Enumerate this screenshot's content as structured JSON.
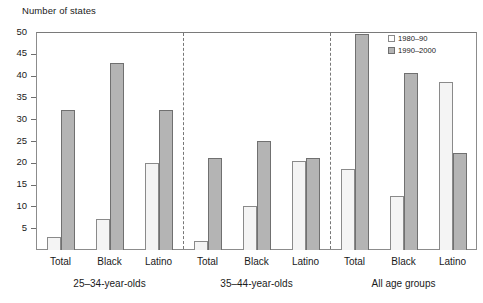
{
  "chart_data": {
    "type": "bar",
    "title": "",
    "subtitle": "",
    "xlabel": "",
    "ylabel": "Number of states",
    "ylim": [
      0,
      50
    ],
    "yticks": [
      0,
      5,
      10,
      15,
      20,
      25,
      30,
      35,
      40,
      45,
      50
    ],
    "ytick_labels": [
      "",
      "5",
      "10",
      "15",
      "20",
      "25",
      "30",
      "35",
      "40",
      "45",
      "50"
    ],
    "grid": false,
    "legend_position": "top-right",
    "categories": [
      "Total",
      "Black",
      "Latino"
    ],
    "panels": [
      {
        "label": "25–34-year-olds",
        "categories": [
          "Total",
          "Black",
          "Latino"
        ],
        "series": [
          {
            "name": "1980–90",
            "values": [
              3,
              7,
              20
            ]
          },
          {
            "name": "1990–2000",
            "values": [
              32,
              43,
              32
            ]
          }
        ]
      },
      {
        "label": "35–44-year-olds",
        "categories": [
          "Total",
          "Black",
          "Latino"
        ],
        "series": [
          {
            "name": "1980–90",
            "values": [
              2,
              10,
              20.5
            ]
          },
          {
            "name": "1990–2000",
            "values": [
              21,
              25,
              21
            ]
          }
        ]
      },
      {
        "label": "All age groups",
        "categories": [
          "Total",
          "Black",
          "Latino"
        ],
        "series": [
          {
            "name": "1980–90",
            "values": [
              18.5,
              12.3,
              38.5
            ]
          },
          {
            "name": "1990–2000",
            "values": [
              49.5,
              40.5,
              22.3
            ]
          }
        ]
      }
    ],
    "series_names": [
      "1980–90",
      "1990–2000"
    ],
    "series_colors": [
      "#f4f4f4",
      "#b4b4b4"
    ]
  },
  "legend": {
    "items": [
      {
        "label": "1980–90",
        "color": "#ffffff"
      },
      {
        "label": "1990–2000",
        "color": "#b4b4b4"
      }
    ]
  },
  "axis": {
    "y_title": "Number of states"
  }
}
